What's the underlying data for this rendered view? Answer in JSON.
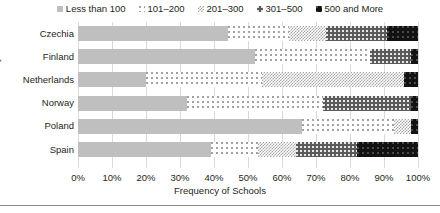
{
  "chart_data": {
    "type": "bar",
    "orientation": "horizontal",
    "stacked": true,
    "normalized": true,
    "title": "",
    "xlabel": "Frequency of Schools",
    "ylabel": "Country",
    "categories": [
      "Czechia",
      "Finland",
      "Netherlands",
      "Norway",
      "Poland",
      "Spain"
    ],
    "series": [
      {
        "name": "Less than 100",
        "values": [
          44,
          52,
          20,
          32,
          66,
          39
        ]
      },
      {
        "name": "101–200",
        "values": [
          18,
          34,
          34,
          40,
          27,
          14
        ]
      },
      {
        "name": "201–300",
        "values": [
          11,
          0,
          42,
          0,
          5,
          11
        ]
      },
      {
        "name": "301–500",
        "values": [
          18,
          12,
          0,
          26,
          0,
          18
        ]
      },
      {
        "name": "500 and More",
        "values": [
          9,
          2,
          4,
          2,
          2,
          18
        ]
      }
    ],
    "xlim": [
      0,
      100
    ],
    "xticks": [
      "0%",
      "10%",
      "20%",
      "30%",
      "40%",
      "50%",
      "60%",
      "70%",
      "80%",
      "90%",
      "100%"
    ],
    "xtick_values": [
      0,
      10,
      20,
      30,
      40,
      50,
      60,
      70,
      80,
      90,
      100
    ],
    "grid": true,
    "grid_axis": "x",
    "legend_position": "top",
    "series_colors": [
      "#bfbfbf",
      "#ffffff",
      "#ffffff",
      "#5a5a5a",
      "#121212"
    ],
    "series_patterns": [
      "solid",
      "sparse-dots",
      "checkerboard",
      "dark-dots",
      "black-dots"
    ]
  },
  "legend": {
    "items": [
      {
        "label": "Less than 100"
      },
      {
        "label": "101–200"
      },
      {
        "label": "201–300"
      },
      {
        "label": "301–500"
      },
      {
        "label": "500 and More"
      }
    ]
  },
  "axes": {
    "y_title": "Country",
    "x_title": "Frequency of Schools"
  }
}
